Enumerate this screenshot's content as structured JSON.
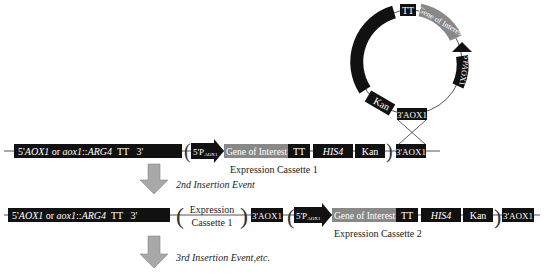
{
  "plasmid": {
    "segments": [
      {
        "label": "HIS4",
        "italic": true,
        "color": "#111111"
      },
      {
        "label": "TT",
        "italic": false,
        "color": "#111111"
      },
      {
        "label": "Gene of Interest",
        "italic": false,
        "color": "#888888"
      },
      {
        "label": "5'PAOX1",
        "italic": false,
        "color": "#111111"
      },
      {
        "label": "3'AOX1",
        "italic": false,
        "color": "#111111"
      },
      {
        "label": "Kan",
        "italic": false,
        "color": "#111111"
      }
    ]
  },
  "row1": {
    "locus": "5'AOX1 or aox1::ARG4   TT   3'",
    "locus_parts": {
      "a": "5'",
      "b": "AOX1",
      "c": " or ",
      "d": "aox1",
      "e": "::",
      "f": "ARG4",
      "g": "  TT   3'"
    },
    "promoter": "5'P",
    "promoter_sub": "AOX1",
    "gene": "Gene of Interest",
    "tt": "TT",
    "his4": "HIS4",
    "kan": "Kan",
    "end": "3'AOX1",
    "caption": "Expression Cassette 1"
  },
  "arrow1": {
    "label": "2nd Insertion Event",
    "color": "#a8a8a8"
  },
  "row2": {
    "locus_parts": {
      "a": "5'",
      "b": "AOX1",
      "c": " or ",
      "d": "aox1",
      "e": "::",
      "f": "ARG4",
      "g": "  TT   3'"
    },
    "cassette_line1": "Expression",
    "cassette_line2": "Cassette 1",
    "mid": "3'AOX1",
    "promoter": "5'P",
    "promoter_sub": "AOX1",
    "gene": "Gene of Interest",
    "tt": "TT",
    "his4": "HIS4",
    "kan": "Kan",
    "end": "3'AOX1",
    "caption": "Expression Cassette 2"
  },
  "arrow2": {
    "label": "3rd Insertion Event,etc.",
    "color": "#a8a8a8"
  }
}
